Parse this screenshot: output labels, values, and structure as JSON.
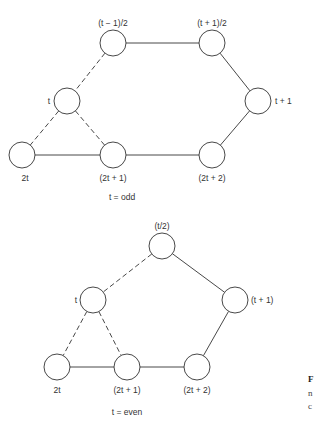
{
  "diagrams": [
    {
      "caption": "t = odd",
      "nodes": [
        {
          "id": "a",
          "label": "(t − 1)/2",
          "x": 113,
          "y": 43,
          "lx": 113,
          "ly": 26,
          "anchor": "middle"
        },
        {
          "id": "b",
          "label": "(t + 1)/2",
          "x": 212,
          "y": 43,
          "lx": 212,
          "ly": 26,
          "anchor": "middle"
        },
        {
          "id": "c",
          "label": "t",
          "x": 67,
          "y": 101,
          "lx": 50,
          "ly": 104,
          "anchor": "end"
        },
        {
          "id": "d",
          "label": "t + 1",
          "x": 258,
          "y": 101,
          "lx": 275,
          "ly": 104,
          "anchor": "start"
        },
        {
          "id": "e",
          "label": "2t",
          "x": 22,
          "y": 155,
          "lx": 25,
          "ly": 181,
          "anchor": "middle"
        },
        {
          "id": "f",
          "label": "(2t + 1)",
          "x": 113,
          "y": 155,
          "lx": 113,
          "ly": 181,
          "anchor": "middle"
        },
        {
          "id": "g",
          "label": "(2t + 2)",
          "x": 212,
          "y": 155,
          "lx": 212,
          "ly": 181,
          "anchor": "middle"
        }
      ],
      "edges": [
        {
          "from": "a",
          "to": "b",
          "style": "solid"
        },
        {
          "from": "b",
          "to": "d",
          "style": "solid"
        },
        {
          "from": "d",
          "to": "g",
          "style": "solid"
        },
        {
          "from": "g",
          "to": "f",
          "style": "solid"
        },
        {
          "from": "f",
          "to": "e",
          "style": "solid"
        },
        {
          "from": "a",
          "to": "c",
          "style": "dashed"
        },
        {
          "from": "c",
          "to": "e",
          "style": "dashed"
        },
        {
          "from": "c",
          "to": "f",
          "style": "dashed"
        }
      ],
      "caption_x": 122,
      "caption_y": 200
    },
    {
      "caption": "t = even",
      "nodes": [
        {
          "id": "a",
          "label": "(t/2)",
          "x": 162,
          "y": 246,
          "lx": 162,
          "ly": 229,
          "anchor": "middle"
        },
        {
          "id": "c",
          "label": "t",
          "x": 93,
          "y": 300,
          "lx": 77,
          "ly": 303,
          "anchor": "end"
        },
        {
          "id": "d",
          "label": "(t + 1)",
          "x": 235,
          "y": 300,
          "lx": 251,
          "ly": 303,
          "anchor": "start"
        },
        {
          "id": "e",
          "label": "2t",
          "x": 57,
          "y": 367,
          "lx": 57,
          "ly": 393,
          "anchor": "middle"
        },
        {
          "id": "f",
          "label": "(2t + 1)",
          "x": 127,
          "y": 367,
          "lx": 127,
          "ly": 393,
          "anchor": "middle"
        },
        {
          "id": "g",
          "label": "(2t + 2)",
          "x": 197,
          "y": 367,
          "lx": 197,
          "ly": 393,
          "anchor": "middle"
        }
      ],
      "edges": [
        {
          "from": "a",
          "to": "d",
          "style": "solid"
        },
        {
          "from": "d",
          "to": "g",
          "style": "solid"
        },
        {
          "from": "g",
          "to": "f",
          "style": "solid"
        },
        {
          "from": "f",
          "to": "e",
          "style": "solid"
        },
        {
          "from": "a",
          "to": "c",
          "style": "dashed"
        },
        {
          "from": "c",
          "to": "e",
          "style": "dashed"
        },
        {
          "from": "c",
          "to": "f",
          "style": "dashed"
        }
      ],
      "caption_x": 127,
      "caption_y": 415
    }
  ],
  "node_radius": 13,
  "margin_text": [
    "F",
    "n",
    "c"
  ],
  "colors": {
    "stroke": "#333333",
    "background": "#ffffff"
  }
}
